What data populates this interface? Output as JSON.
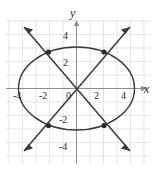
{
  "figure": {
    "title": "",
    "type": "conic-system-graph",
    "axes": {
      "x_axis_label": "x",
      "y_axis_label": "y",
      "x_tick_labels": [
        "-4",
        "-2",
        "0",
        "2",
        "4"
      ],
      "y_tick_labels": [
        "4",
        "2",
        "-2",
        "-4"
      ],
      "origin_label": "0",
      "x_range": [
        -5.5,
        5.5
      ],
      "y_range": [
        -5.2,
        5.2
      ],
      "grid": true,
      "grid_color": "#d8d8e0",
      "axis_color": "#8a8a8a",
      "curve_color": "#3a3a3a"
    },
    "curves": [
      {
        "name": "ellipse",
        "kind": "ellipse",
        "center": [
          0,
          0
        ],
        "semi_axis_x": 4.4,
        "semi_axis_y": 3.2
      },
      {
        "name": "line-rising",
        "kind": "line",
        "slope": 1,
        "intercept": 0.05,
        "arrows": "both"
      },
      {
        "name": "line-falling",
        "kind": "line",
        "slope": -1,
        "intercept": 0.05,
        "arrows": "both"
      }
    ],
    "intersection_points": [
      {
        "label": "top-left",
        "x": -2.1,
        "y": 2.8
      },
      {
        "label": "top-right",
        "x": 2.1,
        "y": 2.8
      },
      {
        "label": "bottom-left",
        "x": -2.1,
        "y": -2.8
      },
      {
        "label": "bottom-right",
        "x": 2.1,
        "y": -2.8
      }
    ],
    "point_color": "#2b2b2b"
  }
}
